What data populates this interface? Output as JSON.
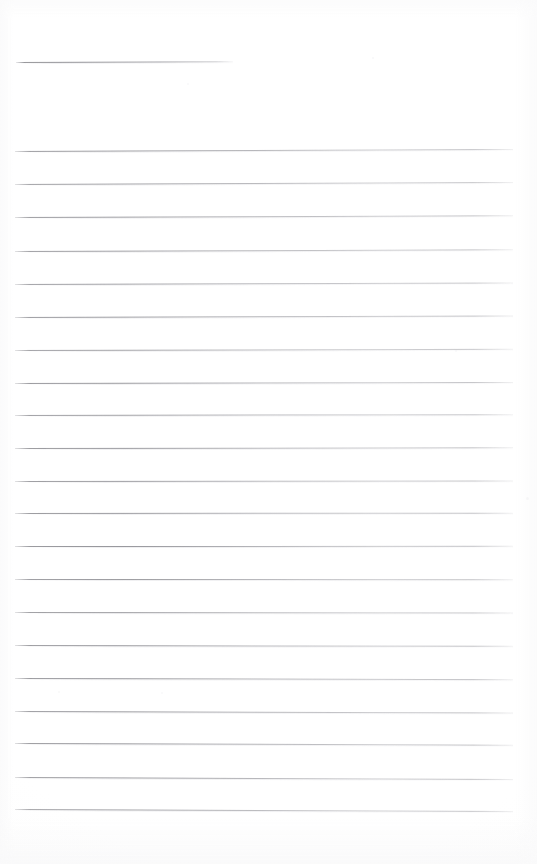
{
  "document": {
    "type": "scanned-lined-paper",
    "title": "Blank ruled notebook page",
    "page_width": 537,
    "page_height": 864,
    "background_color": "#ffffff",
    "rule_color": "#80808a",
    "text_content": "",
    "handwriting": "none",
    "is_blank": true
  },
  "layout": {
    "left_margin_x": 15,
    "right_margin_x": 513,
    "rule_thickness_px": 1,
    "rule_spacing_px": 32.6
  },
  "rules": [
    {
      "index": 1,
      "y": 62,
      "x1": 16,
      "x2": 233,
      "tilt_deg": -0.22,
      "kind": "short",
      "opacity": 0.95
    },
    {
      "index": 2,
      "y": 151,
      "x1": 15,
      "x2": 513,
      "tilt_deg": -0.24,
      "kind": "full",
      "opacity": 0.92
    },
    {
      "index": 3,
      "y": 184,
      "x1": 15,
      "x2": 513,
      "tilt_deg": -0.22,
      "kind": "full",
      "opacity": 0.88
    },
    {
      "index": 4,
      "y": 217,
      "x1": 15,
      "x2": 513,
      "tilt_deg": -0.2,
      "kind": "full",
      "opacity": 0.92
    },
    {
      "index": 5,
      "y": 251,
      "x1": 15,
      "x2": 513,
      "tilt_deg": -0.2,
      "kind": "full",
      "opacity": 0.9
    },
    {
      "index": 6,
      "y": 284,
      "x1": 15,
      "x2": 513,
      "tilt_deg": -0.18,
      "kind": "full",
      "opacity": 0.88
    },
    {
      "index": 7,
      "y": 317,
      "x1": 15,
      "x2": 513,
      "tilt_deg": -0.16,
      "kind": "full",
      "opacity": 0.93
    },
    {
      "index": 8,
      "y": 350,
      "x1": 15,
      "x2": 513,
      "tilt_deg": -0.14,
      "kind": "full",
      "opacity": 0.86
    },
    {
      "index": 9,
      "y": 382.5,
      "x1": 15,
      "x2": 513,
      "tilt_deg": -0.12,
      "kind": "full",
      "opacity": 0.94
    },
    {
      "index": 10,
      "y": 415,
      "x1": 15,
      "x2": 513,
      "tilt_deg": -0.1,
      "kind": "full",
      "opacity": 0.88
    },
    {
      "index": 11,
      "y": 448,
      "x1": 15,
      "x2": 513,
      "tilt_deg": -0.08,
      "kind": "full",
      "opacity": 0.93
    },
    {
      "index": 12,
      "y": 480.5,
      "x1": 15,
      "x2": 513,
      "tilt_deg": -0.06,
      "kind": "full",
      "opacity": 0.9
    },
    {
      "index": 13,
      "y": 513,
      "x1": 15,
      "x2": 513,
      "tilt_deg": -0.04,
      "kind": "full",
      "opacity": 0.92
    },
    {
      "index": 14,
      "y": 546,
      "x1": 15,
      "x2": 513,
      "tilt_deg": -0.02,
      "kind": "full",
      "opacity": 0.95
    },
    {
      "index": 15,
      "y": 578.5,
      "x1": 15,
      "x2": 513,
      "tilt_deg": 0.02,
      "kind": "full",
      "opacity": 0.9
    },
    {
      "index": 16,
      "y": 611.5,
      "x1": 15,
      "x2": 513,
      "tilt_deg": 0.06,
      "kind": "full",
      "opacity": 0.88
    },
    {
      "index": 17,
      "y": 644.5,
      "x1": 15,
      "x2": 513,
      "tilt_deg": 0.1,
      "kind": "full",
      "opacity": 0.92
    },
    {
      "index": 18,
      "y": 677.5,
      "x1": 15,
      "x2": 513,
      "tilt_deg": 0.14,
      "kind": "full",
      "opacity": 0.94
    },
    {
      "index": 19,
      "y": 710.5,
      "x1": 15,
      "x2": 513,
      "tilt_deg": 0.18,
      "kind": "full",
      "opacity": 0.93
    },
    {
      "index": 20,
      "y": 743,
      "x1": 15,
      "x2": 513,
      "tilt_deg": 0.2,
      "kind": "full",
      "opacity": 0.95
    },
    {
      "index": 21,
      "y": 776.5,
      "x1": 15,
      "x2": 513,
      "tilt_deg": 0.22,
      "kind": "full",
      "opacity": 0.92
    },
    {
      "index": 22,
      "y": 809,
      "x1": 15,
      "x2": 513,
      "tilt_deg": 0.24,
      "kind": "full",
      "opacity": 0.86
    }
  ],
  "speckles": [
    {
      "x": 372,
      "y": 57,
      "size": 2,
      "opacity": 0.35
    },
    {
      "x": 187,
      "y": 83,
      "size": 2,
      "opacity": 0.3
    },
    {
      "x": 526,
      "y": 497,
      "size": 3,
      "opacity": 0.4
    },
    {
      "x": 58,
      "y": 691,
      "size": 2,
      "opacity": 0.28
    },
    {
      "x": 455,
      "y": 350,
      "size": 2,
      "opacity": 0.3
    },
    {
      "x": 161,
      "y": 692,
      "size": 2,
      "opacity": 0.25
    }
  ]
}
